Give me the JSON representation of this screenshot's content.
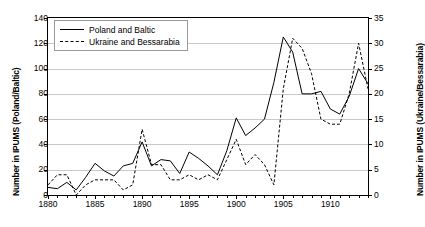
{
  "chart_data": {
    "type": "line",
    "title": "",
    "xlabel": "",
    "ylabel": "Number in IPUMS (Poland/Baltic)",
    "y2label": "Number in IPUMS (Ukraine/Bessarabia)",
    "xlim": [
      1880,
      1914
    ],
    "ylim": [
      0,
      140
    ],
    "y2lim": [
      0,
      35
    ],
    "yticks": [
      0,
      20,
      40,
      60,
      80,
      100,
      120,
      140
    ],
    "y2ticks": [
      0,
      5,
      10,
      15,
      20,
      25,
      30,
      35
    ],
    "xticks": [
      1880,
      1885,
      1890,
      1895,
      1900,
      1905,
      1910
    ],
    "grid": true,
    "legend_position": "upper-left",
    "x": [
      1880,
      1881,
      1882,
      1883,
      1884,
      1885,
      1886,
      1887,
      1888,
      1889,
      1890,
      1891,
      1892,
      1893,
      1894,
      1895,
      1896,
      1897,
      1898,
      1899,
      1900,
      1901,
      1902,
      1903,
      1904,
      1905,
      1906,
      1907,
      1908,
      1909,
      1910,
      1911,
      1912,
      1913,
      1914
    ],
    "series": [
      {
        "name": "Poland and Baltic",
        "axis": "left",
        "style": "solid",
        "color": "#000000",
        "values": [
          6,
          5,
          10,
          4,
          14,
          25,
          19,
          15,
          23,
          25,
          42,
          23,
          28,
          27,
          17,
          34,
          29,
          23,
          16,
          35,
          61,
          47,
          53,
          60,
          89,
          125,
          113,
          80,
          80,
          82,
          68,
          64,
          78,
          100,
          88
        ]
      },
      {
        "name": "Ukraine and Bessarabia",
        "axis": "right",
        "style": "dashed",
        "color": "#000000",
        "values": [
          2,
          4,
          4,
          0,
          2,
          3,
          3,
          3,
          1,
          2,
          13,
          6,
          6,
          3,
          3,
          4,
          3,
          4,
          3,
          7,
          11,
          6,
          8,
          6,
          2,
          21,
          31,
          29,
          24,
          15,
          14,
          14,
          20,
          30,
          21
        ]
      }
    ]
  },
  "legend": {
    "items": [
      {
        "label": "Poland and Baltic",
        "style": "solid"
      },
      {
        "label": "Ukraine and Bessarabia",
        "style": "dashed"
      }
    ]
  }
}
